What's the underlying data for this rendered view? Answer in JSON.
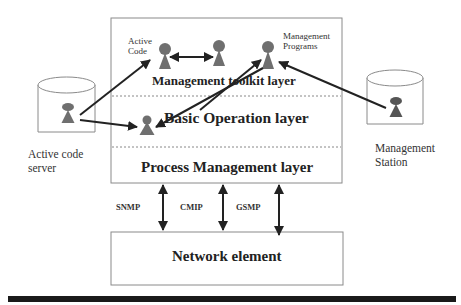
{
  "diagram": {
    "layers": [
      {
        "id": "management-toolkit",
        "label": "Management toolkit layer"
      },
      {
        "id": "basic-operation",
        "label": "Basic Operation layer"
      },
      {
        "id": "process-management",
        "label": "Process Management layer"
      }
    ],
    "network_element": {
      "label": "Network element"
    },
    "protocols": [
      {
        "label": "SNMP"
      },
      {
        "label": "CMIP"
      },
      {
        "label": "GSMP"
      }
    ],
    "nodes": {
      "active_code": {
        "label_line1": "Active",
        "label_line2": "Code"
      },
      "management_programs": {
        "label_line1": "Management",
        "label_line2": "Programs"
      },
      "active_code_server": {
        "label_line1": "Active code",
        "label_line2": "server"
      },
      "management_station": {
        "label_line1": "Management",
        "label_line2": "Station"
      }
    },
    "colors": {
      "figure": "#6f6f6f",
      "arrow": "#222222",
      "box_border": "#8a8a8a",
      "dashed": "#888888",
      "bottom_bar": "#1a1a1a"
    }
  }
}
